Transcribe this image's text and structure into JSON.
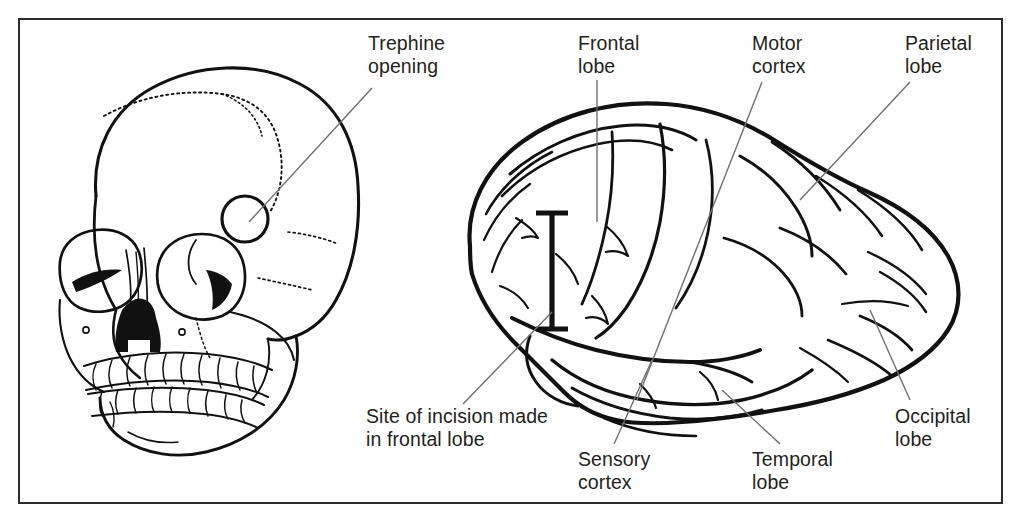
{
  "figure": {
    "border_color": "#2b2b2b",
    "ink_color": "#111111",
    "leader_color": "#6f6f6f",
    "text_color": "#231f20",
    "background": "#ffffff"
  },
  "labels": [
    {
      "id": "trephine-opening",
      "text": "Trephine\nopening",
      "x": 368,
      "y": 32,
      "leader": {
        "x1": 372,
        "y1": 88,
        "x2": 249,
        "y2": 222
      },
      "target": "trephine hole in the frontal bone of the skull"
    },
    {
      "id": "frontal-lobe",
      "text": "Frontal\nlobe",
      "x": 578,
      "y": 32,
      "leader": {
        "x1": 597,
        "y1": 80,
        "x2": 597,
        "y2": 222
      },
      "target": "frontal lobe of the cerebrum"
    },
    {
      "id": "motor-cortex",
      "text": "Motor\ncortex",
      "x": 752,
      "y": 32,
      "leader": {
        "x1": 762,
        "y1": 82,
        "x2": 637,
        "y2": 400
      },
      "target": "precentral gyrus, motor cortex"
    },
    {
      "id": "parietal-lobe",
      "text": "Parietal\nlobe",
      "x": 905,
      "y": 32,
      "leader": {
        "x1": 910,
        "y1": 82,
        "x2": 800,
        "y2": 200
      },
      "target": "parietal lobe of the cerebrum"
    },
    {
      "id": "site-of-incision",
      "text": "Site of incision made\nin frontal lobe",
      "x": 366,
      "y": 405,
      "leader": {
        "x1": 463,
        "y1": 404,
        "x2": 552,
        "y2": 312
      },
      "target": "incision marker drawn on the frontal lobe"
    },
    {
      "id": "sensory-cortex",
      "text": "Sensory\ncortex",
      "x": 578,
      "y": 448,
      "leader": {
        "x1": 614,
        "y1": 444,
        "x2": 652,
        "y2": 360
      },
      "target": "postcentral gyrus, sensory cortex"
    },
    {
      "id": "temporal-lobe",
      "text": "Temporal\nlobe",
      "x": 752,
      "y": 448,
      "leader": {
        "x1": 780,
        "y1": 444,
        "x2": 722,
        "y2": 390
      },
      "target": "temporal lobe of the cerebrum"
    },
    {
      "id": "occipital-lobe",
      "text": "Occipital\nlobe",
      "x": 895,
      "y": 405,
      "leader": {
        "x1": 910,
        "y1": 400,
        "x2": 870,
        "y2": 310
      },
      "target": "occipital lobe of the cerebrum"
    }
  ],
  "skull": {
    "name": "lateral-oblique skull illustration",
    "features": [
      "cranial vault",
      "coronal suture (stippled)",
      "left orbit",
      "right orbit",
      "nasal aperture",
      "zygomatic arch",
      "maxilla with upper teeth",
      "mandible with lower teeth",
      "trephine opening (circular)"
    ],
    "trephine_circle": {
      "cx": 245,
      "cy": 219,
      "r": 23
    }
  },
  "brain": {
    "name": "lateral view of the left cerebral hemisphere",
    "features": [
      "frontal lobe",
      "parietal lobe",
      "temporal lobe",
      "occipital lobe",
      "central sulcus",
      "lateral (Sylvian) fissure",
      "gyri and sulci",
      "cerebellum margin"
    ],
    "incision_marker": {
      "x": 552,
      "y_top": 212,
      "y_bottom": 330
    }
  }
}
